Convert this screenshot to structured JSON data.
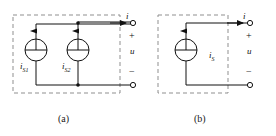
{
  "figure": {
    "width": 276,
    "height": 136,
    "background": "#ffffff",
    "stroke_color": "#1a1a1a",
    "dashed_color": "#8a8a8a"
  },
  "circuits": [
    {
      "id": "a",
      "caption": "(a)",
      "box": {
        "x": 13,
        "y": 15,
        "width": 107,
        "height": 78,
        "style": "dashed"
      },
      "sources": [
        {
          "name": "current-source-1",
          "label": "i",
          "subscript": "S1",
          "cx": 36,
          "cy": 50,
          "r": 11,
          "arrow_direction": "up"
        },
        {
          "name": "current-source-2",
          "label": "i",
          "subscript": "S2",
          "cx": 78,
          "cy": 50,
          "r": 11,
          "arrow_direction": "up"
        }
      ],
      "terminals": [
        {
          "name": "terminal-positive",
          "cx": 133,
          "cy": 22,
          "polarity": "+"
        },
        {
          "name": "terminal-negative",
          "cx": 133,
          "cy": 85,
          "polarity": "−"
        }
      ],
      "current_label": "i",
      "voltage_label": "u",
      "plus_sign": "+",
      "minus_sign": "−"
    },
    {
      "id": "b",
      "caption": "(b)",
      "box": {
        "x": 158,
        "y": 15,
        "width": 70,
        "height": 78,
        "style": "dashed"
      },
      "sources": [
        {
          "name": "current-source-1",
          "label": "i",
          "subscript": "S",
          "cx": 186,
          "cy": 50,
          "r": 11,
          "arrow_direction": "up"
        }
      ],
      "terminals": [
        {
          "name": "terminal-positive",
          "cx": 250,
          "cy": 22,
          "polarity": "+"
        },
        {
          "name": "terminal-negative",
          "cx": 250,
          "cy": 85,
          "polarity": "−"
        }
      ],
      "current_label": "i",
      "voltage_label": "u",
      "plus_sign": "+",
      "minus_sign": "−"
    }
  ]
}
